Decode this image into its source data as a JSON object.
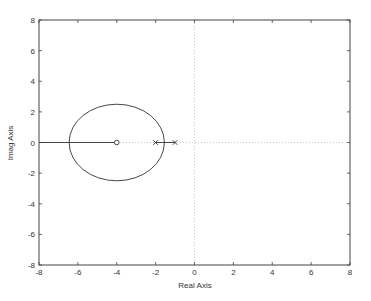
{
  "chart_data": {
    "type": "scatter",
    "title": "",
    "xlabel": "Real Axis",
    "ylabel": "Imag Axis",
    "xlim": [
      -8,
      8
    ],
    "ylim": [
      -8,
      8
    ],
    "xticks": [
      -8,
      -6,
      -4,
      -2,
      0,
      2,
      4,
      6,
      8
    ],
    "yticks": [
      -8,
      -6,
      -4,
      -2,
      0,
      2,
      4,
      6,
      8
    ],
    "xtick_labels": [
      "-8",
      "-6",
      "-4",
      "-2",
      "0",
      "2",
      "4",
      "6",
      "8"
    ],
    "ytick_labels": [
      "-8",
      "-6",
      "-4",
      "-2",
      "0",
      "2",
      "4",
      "6",
      "8"
    ],
    "grid": "dotted lines at x=0 and y=0",
    "legend": null,
    "poles": [
      {
        "re": -2,
        "im": 0
      },
      {
        "re": -1,
        "im": 0
      }
    ],
    "zeros": [
      {
        "re": -4,
        "im": 0
      }
    ],
    "root_locus": {
      "circle": {
        "center_re": -4,
        "center_im": 0,
        "radius_re": 2.45,
        "radius_im": 2.5
      },
      "real_axis_segments": [
        [
          -8,
          -4
        ],
        [
          -2,
          -1
        ]
      ]
    }
  }
}
